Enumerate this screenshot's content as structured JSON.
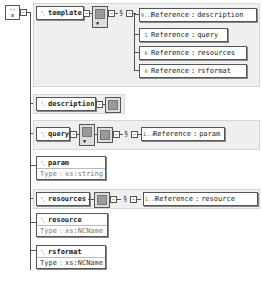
{
  "root": {
    "icon": "root-element-icon",
    "glyph": "‹› ≡"
  },
  "template": {
    "label": "template",
    "icon_glyph": "ᵀ꜀",
    "children_refs": [
      {
        "label": "Reference",
        "sep": ":",
        "target": "description",
        "icon_glyph": "0..1"
      },
      {
        "label": "Reference",
        "sep": ":",
        "target": "query",
        "icon_glyph": "1"
      },
      {
        "label": "Reference",
        "sep": ":",
        "target": "resources",
        "icon_glyph": "0"
      },
      {
        "label": "Reference",
        "sep": ":",
        "target": "rsformat",
        "icon_glyph": "0"
      }
    ]
  },
  "description": {
    "label": "description",
    "icon_glyph": "ᵀ꜀"
  },
  "query": {
    "label": "query",
    "icon_glyph": "ᵀ꜀",
    "ref": {
      "label": "Reference",
      "sep": ":",
      "target": "param",
      "icon_glyph": "1..∞"
    }
  },
  "param": {
    "label": "param",
    "type_label": "Type",
    "type_value": "xs:string"
  },
  "resources": {
    "label": "resources",
    "ref": {
      "label": "Reference",
      "sep": ":",
      "target": "resource",
      "icon_glyph": "1..∞"
    }
  },
  "resource": {
    "label": "resource",
    "type_label": "Type",
    "type_value": "xs:NCName"
  },
  "rsformat": {
    "label": "rsformat",
    "type_label": "Type",
    "type_value": "xs:NCName"
  }
}
